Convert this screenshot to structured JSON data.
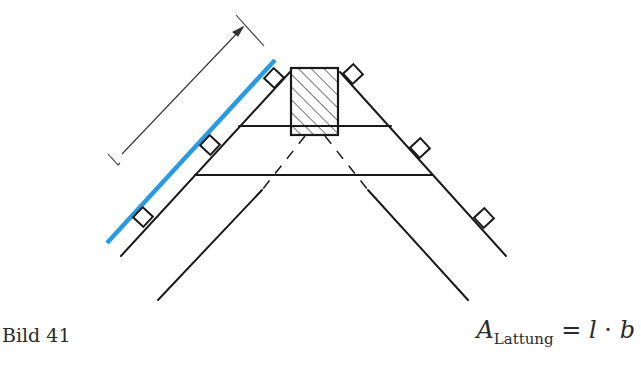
{
  "figure": {
    "caption": "Bild 41",
    "formula": {
      "lhs_symbol": "A",
      "lhs_subscript": "Lattung",
      "equals": "=",
      "rhs_a": "l",
      "operator": "·",
      "rhs_b": "b"
    }
  },
  "colors": {
    "line": "#1a1a1a",
    "highlight": "#2a9be0",
    "hatch": "#1a1a1a"
  },
  "diagram": {
    "dimension_label": "l",
    "elements": [
      "ridge-purlin",
      "rafters",
      "battens",
      "collar-ties",
      "highlighted-batten-surface",
      "dimension-line"
    ]
  }
}
